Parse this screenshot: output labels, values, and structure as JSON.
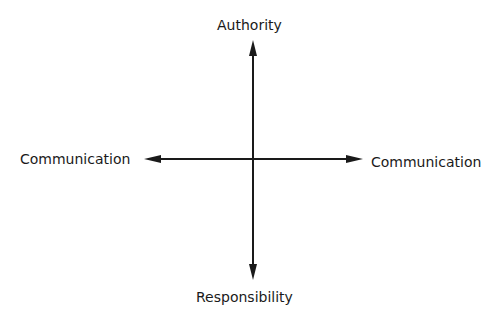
{
  "diagram": {
    "type": "cross-axes",
    "labels": {
      "top": "Authority",
      "bottom": "Responsibility",
      "left": "Communication",
      "right": "Communication"
    },
    "colors": {
      "line": "#1a1a1a",
      "background": "#ffffff"
    }
  }
}
